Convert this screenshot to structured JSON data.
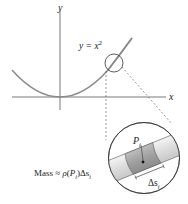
{
  "diagram": {
    "axes": {
      "x_label": "x",
      "y_label": "y"
    },
    "curve": {
      "equation_lhs": "y = x",
      "equation_exp": "2"
    },
    "zoom_detail": {
      "point_label": "P",
      "point_sub": "i",
      "segment_label": "Δs",
      "segment_sub": "i"
    },
    "mass_formula": {
      "prefix": "Mass ≈ ",
      "rho": "ρ",
      "open": "(",
      "P": "P",
      "P_sub": "i",
      "close": ")Δs",
      "s_sub": "i"
    },
    "colors": {
      "curve": "#8a8a8a",
      "axis": "#444444",
      "tube_light": "#e6e6e6",
      "tube_dark": "#a9a9a9"
    }
  }
}
